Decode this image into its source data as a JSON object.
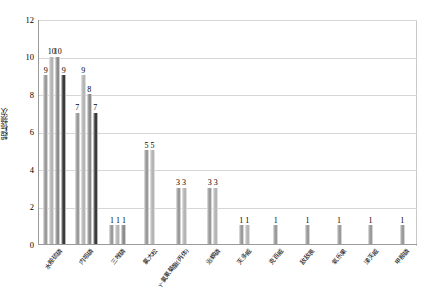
{
  "chart_data": {
    "type": "bar",
    "title": "",
    "xlabel": "",
    "ylabel": "超标频次",
    "ylim": [
      0,
      12
    ],
    "ytick_step": 2,
    "yticks": [
      "0",
      "2",
      "4",
      "6",
      "8",
      "10",
      "12"
    ],
    "grid": true,
    "legend": "none",
    "categories": [
      "水胺硫磷",
      "内吸磷",
      "三唑磷",
      "氯大松",
      "γ-氯氰菊酯(丙体)",
      "治螟磷",
      "灭多威",
      "克百威",
      "敌敌畏",
      "氧乐果",
      "涕灭威",
      "甲胺磷"
    ],
    "groups": [
      {
        "category": "水胺硫磷",
        "values": [
          9,
          10,
          10,
          9
        ],
        "labels": [
          "9",
          "10",
          "10",
          "9"
        ]
      },
      {
        "category": "内吸磷",
        "values": [
          7,
          9,
          8,
          7
        ],
        "labels": [
          "7",
          "9",
          "8",
          "7"
        ]
      },
      {
        "category": "三唑磷",
        "values": [
          1,
          1,
          1
        ],
        "labels": [
          "1",
          "1",
          "1"
        ]
      },
      {
        "category": "氯大松",
        "values": [
          5,
          5
        ],
        "labels": [
          "5",
          "5"
        ]
      },
      {
        "category": "γ-氯氰菊酯(丙体)",
        "values": [
          3,
          3
        ],
        "labels": [
          "3",
          "3"
        ]
      },
      {
        "category": "治螟磷",
        "values": [
          3,
          3
        ],
        "labels": [
          "3",
          "3"
        ]
      },
      {
        "category": "灭多威",
        "values": [
          1,
          1
        ],
        "labels": [
          "1",
          "1"
        ]
      },
      {
        "category": "克百威",
        "values": [
          1
        ],
        "labels": [
          "1"
        ]
      },
      {
        "category": "敌敌畏",
        "values": [
          1
        ],
        "labels": [
          "1"
        ]
      },
      {
        "category": "氧乐果",
        "values": [
          1
        ],
        "labels": [
          "1"
        ]
      },
      {
        "category": "涕灭威",
        "values": [
          1
        ],
        "labels": [
          "1"
        ]
      },
      {
        "category": "甲胺磷",
        "values": [
          1
        ],
        "labels": [
          "1"
        ]
      }
    ],
    "series_colors": [
      "#9a9a9a",
      "#b5b5b5",
      "#8c8c8c",
      "#3a3a3a"
    ]
  },
  "axis": {
    "plot_bg": "#ffffff",
    "gridline_color": "#d6d6d6",
    "axis_line_color": "#9a9a9a"
  }
}
